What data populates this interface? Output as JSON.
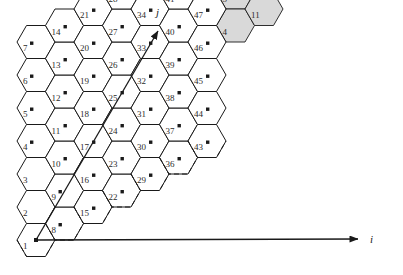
{
  "figure": {
    "type": "hexagonal-cellular-reuse-diagram",
    "background": "#ffffff",
    "line_color": "#1a1a1a",
    "shade_color": "#d9d9d9",
    "label_color": "#2b2b2b",
    "marker_color": "#1a1a1a"
  },
  "axes": {
    "i": {
      "label": "i",
      "label_x": 370,
      "label_y": 243,
      "tip_x": 358,
      "tip_y": 239
    },
    "j": {
      "label": "j",
      "label_x": 156,
      "label_y": 16,
      "tip_x": 158,
      "tip_y": 31
    },
    "origin_x": 36,
    "origin_y": 240
  },
  "geometry": {
    "hex_width": 38,
    "hex_height": 33,
    "col_step": 28.5,
    "row_step": 33,
    "col_rise": 16.5,
    "origin_cx": 36,
    "origin_cy": 240
  },
  "grid": {
    "columns": 7,
    "rows": 7,
    "cells": [
      {
        "n": "1",
        "col": 0,
        "row": 0,
        "marker": false
      },
      {
        "n": "2",
        "col": 0,
        "row": 1,
        "marker": false
      },
      {
        "n": "3",
        "col": 0,
        "row": 2,
        "marker": false
      },
      {
        "n": "4",
        "col": 0,
        "row": 3,
        "marker": true
      },
      {
        "n": "5",
        "col": 0,
        "row": 4,
        "marker": true
      },
      {
        "n": "6",
        "col": 0,
        "row": 5,
        "marker": true
      },
      {
        "n": "7",
        "col": 0,
        "row": 6,
        "marker": true
      },
      {
        "n": "8",
        "col": 1,
        "row": 0,
        "marker": true
      },
      {
        "n": "9",
        "col": 1,
        "row": 1,
        "marker": true
      },
      {
        "n": "10",
        "col": 1,
        "row": 2,
        "marker": true
      },
      {
        "n": "11",
        "col": 1,
        "row": 3,
        "marker": true
      },
      {
        "n": "12",
        "col": 1,
        "row": 4,
        "marker": true
      },
      {
        "n": "13",
        "col": 1,
        "row": 5,
        "marker": true
      },
      {
        "n": "14",
        "col": 1,
        "row": 6,
        "marker": true
      },
      {
        "n": "15",
        "col": 2,
        "row": 0,
        "marker": true
      },
      {
        "n": "16",
        "col": 2,
        "row": 1,
        "marker": true
      },
      {
        "n": "17",
        "col": 2,
        "row": 2,
        "marker": true
      },
      {
        "n": "18",
        "col": 2,
        "row": 3,
        "marker": true
      },
      {
        "n": "19",
        "col": 2,
        "row": 4,
        "marker": true
      },
      {
        "n": "20",
        "col": 2,
        "row": 5,
        "marker": true
      },
      {
        "n": "21",
        "col": 2,
        "row": 6,
        "marker": true
      },
      {
        "n": "22",
        "col": 3,
        "row": 0,
        "marker": true
      },
      {
        "n": "23",
        "col": 3,
        "row": 1,
        "marker": true
      },
      {
        "n": "24",
        "col": 3,
        "row": 2,
        "marker": true
      },
      {
        "n": "25",
        "col": 3,
        "row": 3,
        "marker": true
      },
      {
        "n": "26",
        "col": 3,
        "row": 4,
        "marker": true
      },
      {
        "n": "27",
        "col": 3,
        "row": 5,
        "marker": true
      },
      {
        "n": "28",
        "col": 3,
        "row": 6,
        "marker": true
      },
      {
        "n": "29",
        "col": 4,
        "row": 0,
        "marker": true
      },
      {
        "n": "30",
        "col": 4,
        "row": 1,
        "marker": true
      },
      {
        "n": "31",
        "col": 4,
        "row": 2,
        "marker": true
      },
      {
        "n": "32",
        "col": 4,
        "row": 3,
        "marker": true
      },
      {
        "n": "33",
        "col": 4,
        "row": 4,
        "marker": true
      },
      {
        "n": "34",
        "col": 4,
        "row": 5,
        "marker": true
      },
      {
        "n": "35",
        "col": 4,
        "row": 6,
        "marker": true
      },
      {
        "n": "36",
        "col": 5,
        "row": 0,
        "marker": true
      },
      {
        "n": "37",
        "col": 5,
        "row": 1,
        "marker": true
      },
      {
        "n": "38",
        "col": 5,
        "row": 2,
        "marker": true
      },
      {
        "n": "39",
        "col": 5,
        "row": 3,
        "marker": true
      },
      {
        "n": "40",
        "col": 5,
        "row": 4,
        "marker": true
      },
      {
        "n": "41",
        "col": 5,
        "row": 5,
        "marker": true
      },
      {
        "n": "42",
        "col": 5,
        "row": 6,
        "marker": true
      },
      {
        "n": "43",
        "col": 6,
        "row": 0,
        "marker": true
      },
      {
        "n": "44",
        "col": 6,
        "row": 1,
        "marker": true
      },
      {
        "n": "45",
        "col": 6,
        "row": 2,
        "marker": true
      },
      {
        "n": "46",
        "col": 6,
        "row": 3,
        "marker": true
      },
      {
        "n": "47",
        "col": 6,
        "row": 4,
        "marker": true
      },
      {
        "n": "48",
        "col": 6,
        "row": 5,
        "marker": true
      },
      {
        "n": "49",
        "col": 6,
        "row": 6,
        "marker": true
      }
    ],
    "shaded_cells": [
      {
        "n": "29",
        "col": 4,
        "row": 7,
        "marker": false
      },
      {
        "n": "36",
        "col": 5,
        "row": 7,
        "marker": false
      },
      {
        "n": "43",
        "col": 6,
        "row": 7,
        "marker": false
      },
      {
        "n": "7",
        "col": 7,
        "row": 6,
        "marker": false
      },
      {
        "n": "6",
        "col": 7,
        "row": 5,
        "marker": false
      },
      {
        "n": "13",
        "col": 8,
        "row": 5,
        "marker": false
      },
      {
        "n": "5",
        "col": 7,
        "row": 4,
        "marker": false
      },
      {
        "n": "12",
        "col": 8,
        "row": 4,
        "marker": false
      },
      {
        "n": "4",
        "col": 7,
        "row": 3,
        "marker": false
      },
      {
        "n": "11",
        "col": 8,
        "row": 3,
        "marker": false
      }
    ]
  }
}
